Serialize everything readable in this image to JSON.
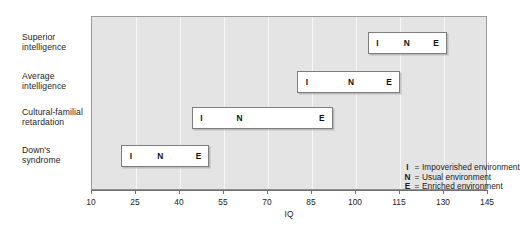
{
  "chart_data": {
    "type": "bar",
    "orientation": "horizontal",
    "title": "",
    "xlabel": "IQ",
    "ylabel": "",
    "xlim": [
      10,
      145
    ],
    "xticks": [
      10,
      25,
      40,
      55,
      70,
      85,
      100,
      115,
      130,
      145
    ],
    "grid": true,
    "legend_position": "inside-bottom-right",
    "categories": [
      "Superior intelligence",
      "Average intelligence",
      "Cultural-familial retardation",
      "Down's syndrome"
    ],
    "series": [
      {
        "name": "Superior intelligence",
        "label_lines": [
          "Superior",
          "intelligence"
        ],
        "start": 104,
        "end": 131,
        "points": [
          {
            "key": "I",
            "value": 107
          },
          {
            "key": "N",
            "value": 117
          },
          {
            "key": "E",
            "value": 127
          }
        ]
      },
      {
        "name": "Average intelligence",
        "label_lines": [
          "Average",
          "intelligence"
        ],
        "start": 80,
        "end": 115,
        "points": [
          {
            "key": "I",
            "value": 83
          },
          {
            "key": "N",
            "value": 98
          },
          {
            "key": "E",
            "value": 111
          }
        ]
      },
      {
        "name": "Cultural-familial retardation",
        "label_lines": [
          "Cultural-familial",
          "retardation"
        ],
        "start": 44,
        "end": 92,
        "points": [
          {
            "key": "I",
            "value": 47
          },
          {
            "key": "N",
            "value": 60
          },
          {
            "key": "E",
            "value": 88
          }
        ]
      },
      {
        "name": "Down's syndrome",
        "label_lines": [
          "Down's",
          "syndrome"
        ],
        "start": 20,
        "end": 50,
        "points": [
          {
            "key": "I",
            "value": 23
          },
          {
            "key": "N",
            "value": 33
          },
          {
            "key": "E",
            "value": 46
          }
        ]
      }
    ],
    "legend": [
      {
        "key": "I",
        "eq": "=",
        "label": "Impoverished environment"
      },
      {
        "key": "N",
        "eq": "=",
        "label": "Usual environment"
      },
      {
        "key": "E",
        "eq": "=",
        "label": "Enriched environment"
      }
    ]
  },
  "colors": {
    "panel_background": "#e4e4e4",
    "panel_border": "#9a9a9a",
    "gridline": "#f7f7f7",
    "bar_fill": "#ffffff",
    "bar_border": "#7d7d7d",
    "text": "#232323",
    "axis": "#6f6f6f",
    "page_background": "#ffffff"
  }
}
